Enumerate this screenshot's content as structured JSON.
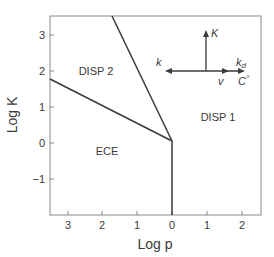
{
  "figure": {
    "xlabel": "Log p",
    "ylabel": "Log K",
    "x_ticks": [
      "3",
      "2",
      "1",
      "0",
      "1",
      "2"
    ],
    "y_ticks": [
      "3",
      "2",
      "1",
      "0",
      "−1"
    ],
    "regions": {
      "disp2": "DISP 2",
      "disp1": "DISP 1",
      "ece": "ECE"
    },
    "inset": {
      "up_label": "K",
      "left_label": "k",
      "right_top_label": "k",
      "right_top_sub": "d",
      "mid_label": "v",
      "right_bottom_label": "C",
      "right_bottom_sup": "°"
    },
    "colors": {
      "axis": "#8a8a8a",
      "line": "#3a3a3a",
      "text": "#3a3a3a"
    }
  }
}
